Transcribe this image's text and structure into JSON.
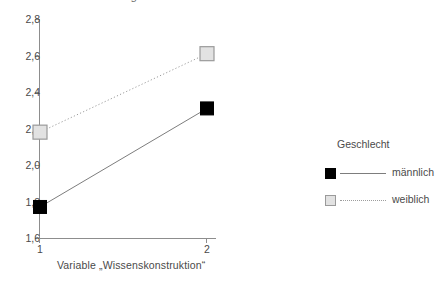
{
  "chart_data": {
    "type": "line",
    "title": "Wechselwirkung zwischen Wissenskonstruktion und Geschlecht",
    "title_cropped": true,
    "xlabel": "Variable „Wissenskonstruktion“",
    "ylabel": "",
    "categories": [
      "1",
      "2"
    ],
    "x": [
      1,
      2
    ],
    "ylim": [
      1.6,
      2.8
    ],
    "yticks": [
      1.6,
      1.8,
      2.0,
      2.2,
      2.4,
      2.6,
      2.8
    ],
    "ytick_labels": [
      "1,6",
      "1,8",
      "2,0",
      "2,2",
      "2,4",
      "2,6",
      "2,8"
    ],
    "xtick_labels": [
      "1",
      "2"
    ],
    "grid": false,
    "legend_position": "right",
    "legend_title": "Geschlecht",
    "series": [
      {
        "name": "männlich",
        "values": [
          1.77,
          2.31
        ],
        "marker": "square-filled",
        "marker_color": "#000000",
        "line_style": "solid",
        "line_color": "#7d7d7d"
      },
      {
        "name": "weiblich",
        "values": [
          2.18,
          2.61
        ],
        "marker": "square-hollow",
        "marker_color": "#e2e2e2",
        "marker_edge_color": "#9a9a9a",
        "line_style": "dotted",
        "line_color": "#9d9d9d"
      }
    ]
  },
  "legend": {
    "title": "Geschlecht",
    "entries": [
      {
        "label": "männlich"
      },
      {
        "label": "weiblich"
      }
    ]
  },
  "axes": {
    "x_title": "Variable „Wissenskonstruktion“",
    "y_tick_labels": [
      "2,8",
      "2,6",
      "2,4",
      "2,2",
      "2,0",
      "1,8",
      "1,6"
    ],
    "x_tick_labels": [
      "1",
      "2"
    ]
  },
  "colors": {
    "axis": "#8d8d8d",
    "text": "#4a4a4a",
    "male_marker": "#000000",
    "female_marker": "#e2e2e2",
    "female_marker_edge": "#9a9a9a",
    "solid_line": "#7d7d7d",
    "dotted_line": "#9d9d9d",
    "background": "#ffffff"
  }
}
